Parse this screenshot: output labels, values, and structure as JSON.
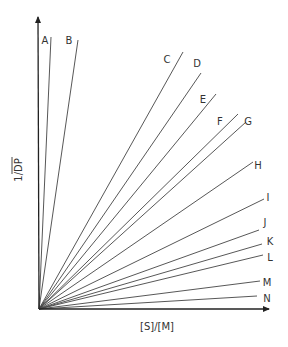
{
  "diagram": {
    "type": "line-family-from-origin",
    "colors": {
      "line": "#444444",
      "axis": "#222222",
      "text": "#333333",
      "background": "#ffffff"
    },
    "origin": [
      39,
      309
    ],
    "y_axis": {
      "label": "1/DP",
      "overline": "DP",
      "tip": [
        38,
        17
      ]
    },
    "x_axis": {
      "label": "[S]/[M]",
      "tip": [
        269,
        309
      ]
    },
    "lines": [
      {
        "label": "A",
        "end": [
          51,
          37
        ],
        "label_pos": [
          45,
          44
        ]
      },
      {
        "label": "B",
        "end": [
          78,
          40
        ],
        "label_pos": [
          69,
          44
        ]
      },
      {
        "label": "C",
        "end": [
          183,
          52
        ],
        "label_pos": [
          167,
          63
        ]
      },
      {
        "label": "D",
        "end": [
          201,
          73
        ],
        "label_pos": [
          197,
          67
        ]
      },
      {
        "label": "E",
        "end": [
          216,
          94
        ],
        "label_pos": [
          203,
          103
        ]
      },
      {
        "label": "F",
        "end": [
          238,
          114
        ],
        "label_pos": [
          220,
          125
        ]
      },
      {
        "label": "G",
        "end": [
          246,
          122
        ],
        "label_pos": [
          248,
          125
        ]
      },
      {
        "label": "H",
        "end": [
          253,
          162
        ],
        "label_pos": [
          258,
          169
        ]
      },
      {
        "label": "I",
        "end": [
          264,
          199
        ],
        "label_pos": [
          268,
          201
        ]
      },
      {
        "label": "J",
        "end": [
          259,
          230
        ],
        "label_pos": [
          265,
          226
        ]
      },
      {
        "label": "K",
        "end": [
          262,
          244
        ],
        "label_pos": [
          270,
          245
        ]
      },
      {
        "label": "L",
        "end": [
          263,
          255
        ],
        "label_pos": [
          270,
          261
        ]
      },
      {
        "label": "M",
        "end": [
          260,
          281
        ],
        "label_pos": [
          267,
          286
        ]
      },
      {
        "label": "N",
        "end": [
          257,
          296
        ],
        "label_pos": [
          267,
          302
        ]
      }
    ]
  }
}
